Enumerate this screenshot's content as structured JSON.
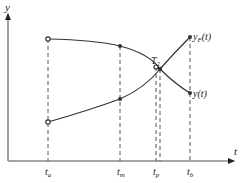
{
  "diagram": {
    "axes": {
      "y_label": "y",
      "x_label": "t"
    },
    "ticks": [
      {
        "id": "ta",
        "base": "t",
        "sub": "a"
      },
      {
        "id": "tm",
        "base": "t",
        "sub": "m"
      },
      {
        "id": "tp",
        "base": "t",
        "sub": "p"
      },
      {
        "id": "tb",
        "base": "t",
        "sub": "b"
      }
    ],
    "curves": [
      {
        "id": "yF",
        "label": "y_F(t)",
        "base": "y",
        "sub": "F",
        "arg": "(t)",
        "trend": "increasing"
      },
      {
        "id": "y",
        "label": "y(t)",
        "base": "y",
        "sub": "",
        "arg": "(t)",
        "trend": "decreasing"
      }
    ],
    "intersection": {
      "base": "T",
      "sub": "2"
    },
    "colors": {
      "axis": "#888888",
      "curve": "#333333",
      "dashed": "#555555",
      "text": "#222222"
    }
  }
}
